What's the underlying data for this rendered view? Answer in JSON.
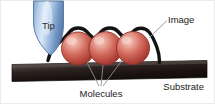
{
  "figure": {
    "type": "schematic-diagram",
    "background_color": "#ffffff",
    "width": 215,
    "height": 104
  },
  "labels": {
    "tip": "Tip",
    "image": "Image",
    "molecules": "Molecules",
    "substrate": "Substrate"
  },
  "elements": {
    "tip": {
      "name": "Tip",
      "shape": "rounded-cone",
      "fill_light": "#cfe0f2",
      "fill_mid": "#8fb4dc",
      "fill_dark": "#5a7fae",
      "outline": "#4a6d99"
    },
    "molecules": {
      "name": "Molecules",
      "count": 3,
      "shape": "sphere",
      "fill_highlight": "#f0b9ad",
      "fill_mid": "#d4675b",
      "fill_dark": "#a33b33",
      "outline": "#8b2f28"
    },
    "image_trace": {
      "name": "Image",
      "description": "thick black contour line tracing over the molecule tops",
      "color": "#111111",
      "stroke_width": 3.4
    },
    "substrate": {
      "name": "Substrate",
      "shape": "slab",
      "fill_light": "#4b4240",
      "fill_dark": "#1d1514",
      "outline": "#0d0908"
    },
    "leader_lines": {
      "color": "#8c8c8c",
      "stroke_width": 0.9,
      "count": 3
    },
    "image_leader": {
      "color": "#8c8c8c",
      "stroke_width": 0.9
    }
  },
  "colors": {
    "background": "#ffffff",
    "text": "#1b1b1b",
    "border": "#e3e3e3"
  }
}
